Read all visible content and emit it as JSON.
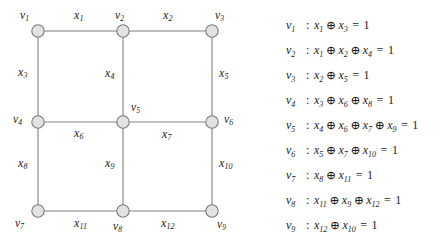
{
  "figure": {
    "background_color": "#ffffff",
    "line_color": "#808080",
    "node_fill_color": "#e2e2e2",
    "node_stroke_color": "#7a7a7a",
    "text_color": "#1c1c1c"
  },
  "graph": {
    "nodes": [
      {
        "id": "v1",
        "name": "v",
        "sub": "1",
        "cx": 38,
        "cy": 31,
        "label_x": 20,
        "label_y": 10
      },
      {
        "id": "v2",
        "name": "v",
        "sub": "2",
        "cx": 123,
        "cy": 31,
        "label_x": 115,
        "label_y": 10
      },
      {
        "id": "v3",
        "name": "v",
        "sub": "3",
        "cx": 212,
        "cy": 31,
        "label_x": 215,
        "label_y": 10
      },
      {
        "id": "v4",
        "name": "v",
        "sub": "4",
        "cx": 38,
        "cy": 122,
        "label_x": 13,
        "label_y": 114
      },
      {
        "id": "v5",
        "name": "v",
        "sub": "5",
        "cx": 123,
        "cy": 122,
        "label_x": 131,
        "label_y": 102
      },
      {
        "id": "v6",
        "name": "v",
        "sub": "6",
        "cx": 212,
        "cy": 122,
        "label_x": 224,
        "label_y": 114
      },
      {
        "id": "v7",
        "name": "v",
        "sub": "7",
        "cx": 38,
        "cy": 211,
        "label_x": 15,
        "label_y": 218
      },
      {
        "id": "v8",
        "name": "v",
        "sub": "8",
        "cx": 123,
        "cy": 211,
        "label_x": 113,
        "label_y": 221
      },
      {
        "id": "v9",
        "name": "v",
        "sub": "9",
        "cx": 212,
        "cy": 211,
        "label_x": 217,
        "label_y": 219
      }
    ],
    "edges": [
      {
        "id": "x1",
        "name": "x",
        "sub": "1",
        "from": "v1",
        "to": "v2",
        "label_x": 74,
        "label_y": 9
      },
      {
        "id": "x2",
        "name": "x",
        "sub": "2",
        "from": "v2",
        "to": "v3",
        "label_x": 163,
        "label_y": 9
      },
      {
        "id": "x3",
        "name": "x",
        "sub": "3",
        "from": "v1",
        "to": "v4",
        "label_x": 18,
        "label_y": 66
      },
      {
        "id": "x4",
        "name": "x",
        "sub": "4",
        "from": "v2",
        "to": "v5",
        "label_x": 105,
        "label_y": 67
      },
      {
        "id": "x5",
        "name": "x",
        "sub": "5",
        "from": "v3",
        "to": "v6",
        "label_x": 219,
        "label_y": 67
      },
      {
        "id": "x6",
        "name": "x",
        "sub": "6",
        "from": "v4",
        "to": "v5",
        "label_x": 74,
        "label_y": 127
      },
      {
        "id": "x7",
        "name": "x",
        "sub": "7",
        "from": "v5",
        "to": "v6",
        "label_x": 162,
        "label_y": 128
      },
      {
        "id": "x8",
        "name": "x",
        "sub": "8",
        "from": "v4",
        "to": "v7",
        "label_x": 18,
        "label_y": 157
      },
      {
        "id": "x9",
        "name": "x",
        "sub": "9",
        "from": "v5",
        "to": "v8",
        "label_x": 105,
        "label_y": 157
      },
      {
        "id": "x10",
        "name": "x",
        "sub": "10",
        "from": "v6",
        "to": "v9",
        "label_x": 219,
        "label_y": 157
      },
      {
        "id": "x11",
        "name": "x",
        "sub": "11",
        "from": "v7",
        "to": "v8",
        "label_x": 74,
        "label_y": 217
      },
      {
        "id": "x12",
        "name": "x",
        "sub": "12",
        "from": "v8",
        "to": "v9",
        "label_x": 161,
        "label_y": 217
      }
    ]
  },
  "equations": {
    "operator_symbol": "⊕",
    "equals_symbol": "=",
    "colon": ":",
    "rows": [
      {
        "vertex": "v",
        "vertex_sub": "1",
        "terms": [
          {
            "v": "x",
            "sub": "1"
          },
          {
            "v": "x",
            "sub": "3"
          }
        ],
        "rhs": "1",
        "y": 18
      },
      {
        "vertex": "v",
        "vertex_sub": "2",
        "terms": [
          {
            "v": "x",
            "sub": "1"
          },
          {
            "v": "x",
            "sub": "2"
          },
          {
            "v": "x",
            "sub": "4"
          }
        ],
        "rhs": "1",
        "y": 43
      },
      {
        "vertex": "v",
        "vertex_sub": "3",
        "terms": [
          {
            "v": "x",
            "sub": "2"
          },
          {
            "v": "x",
            "sub": "5"
          }
        ],
        "rhs": "1",
        "y": 68
      },
      {
        "vertex": "v",
        "vertex_sub": "4",
        "terms": [
          {
            "v": "x",
            "sub": "3"
          },
          {
            "v": "x",
            "sub": "6"
          },
          {
            "v": "x",
            "sub": "8"
          }
        ],
        "rhs": "1",
        "y": 93
      },
      {
        "vertex": "v",
        "vertex_sub": "5",
        "terms": [
          {
            "v": "x",
            "sub": "4"
          },
          {
            "v": "x",
            "sub": "6"
          },
          {
            "v": "x",
            "sub": "7"
          },
          {
            "v": "x",
            "sub": "9"
          }
        ],
        "rhs": "1",
        "y": 118
      },
      {
        "vertex": "v",
        "vertex_sub": "6",
        "terms": [
          {
            "v": "x",
            "sub": "5"
          },
          {
            "v": "x",
            "sub": "7"
          },
          {
            "v": "x",
            "sub": "10"
          }
        ],
        "rhs": "1",
        "y": 143
      },
      {
        "vertex": "v",
        "vertex_sub": "7",
        "terms": [
          {
            "v": "x",
            "sub": "8"
          },
          {
            "v": "x",
            "sub": "11"
          }
        ],
        "rhs": "1",
        "y": 168
      },
      {
        "vertex": "v",
        "vertex_sub": "8",
        "terms": [
          {
            "v": "x",
            "sub": "11"
          },
          {
            "v": "x",
            "sub": "9"
          },
          {
            "v": "x",
            "sub": "12"
          }
        ],
        "rhs": "1",
        "y": 193
      },
      {
        "vertex": "v",
        "vertex_sub": "9",
        "terms": [
          {
            "v": "x",
            "sub": "12"
          },
          {
            "v": "x",
            "sub": "10"
          }
        ],
        "rhs": "1",
        "y": 218
      }
    ]
  }
}
